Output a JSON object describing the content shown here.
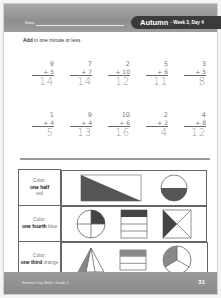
{
  "header": {
    "name_label": "Name",
    "title": "Autumn",
    "subtitle": "- Week 3, Day 4"
  },
  "instruction": {
    "bold": "Add",
    "rest": " in one minute or less."
  },
  "problems": {
    "row1": [
      {
        "top": "9",
        "addend": "+ 5",
        "answer": "14"
      },
      {
        "top": "7",
        "addend": "+ 7",
        "answer": "14"
      },
      {
        "top": "2",
        "addend": "+ 10",
        "answer": "12"
      },
      {
        "top": "5",
        "addend": "+ 6",
        "answer": "11"
      },
      {
        "top": "3",
        "addend": "+ 5",
        "answer": "8"
      }
    ],
    "row2": [
      {
        "top": "1",
        "addend": "+ 4",
        "answer": "5"
      },
      {
        "top": "9",
        "addend": "+ 4",
        "answer": "13"
      },
      {
        "top": "10",
        "addend": "+ 6",
        "answer": "16"
      },
      {
        "top": "2",
        "addend": "+ 2",
        "answer": "4"
      },
      {
        "top": "4",
        "addend": "+ 8",
        "answer": "12"
      }
    ]
  },
  "fractions": [
    {
      "prefix": "Color:",
      "fraction": "one half",
      "color": "red",
      "fill": "#555555"
    },
    {
      "prefix": "Color:",
      "fraction": "one fourth",
      "color": "blue",
      "fill": "#444444"
    },
    {
      "prefix": "Color:",
      "fraction": "one third",
      "color": "orange",
      "fill": "#888888"
    }
  ],
  "footer": {
    "left": "Summer Day Skills • Grade 2",
    "page": "31"
  }
}
